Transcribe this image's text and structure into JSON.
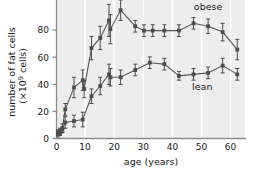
{
  "chart_data": {
    "type": "line",
    "title": "",
    "subtitle": "",
    "xlabel": "age (years)",
    "ylabel_line1": "number of fat cells",
    "ylabel_line2_prefix": "(×10",
    "ylabel_line2_exp": "9",
    "ylabel_line2_suffix": " cells)",
    "ylabel_full": "number of fat cells (×10⁹ cells)",
    "xlim": [
      0,
      65
    ],
    "ylim": [
      0,
      95
    ],
    "xticks": [
      0,
      10,
      20,
      30,
      40,
      50,
      60
    ],
    "xticklabels": [
      "0",
      "10",
      "20",
      "30",
      "40",
      "50",
      "60"
    ],
    "yticks": [
      0,
      20,
      40,
      60,
      80
    ],
    "yticklabels": [
      "0",
      "20",
      "40",
      "60",
      "80"
    ],
    "grid": "vertical-white-bands",
    "legend_position": "inline-annotation",
    "error_bars": "vertical",
    "marker": "filled-square",
    "plot_background": "#eeeeee",
    "line_color": "#595959",
    "marker_color": "#4d4d4d",
    "axis_color": "#808080",
    "gridline_color": "#ffffff",
    "annotations": [
      {
        "text": "obese",
        "x": 52,
        "y": 88
      },
      {
        "text": "lean",
        "x": 50,
        "y": 33
      }
    ],
    "series": [
      {
        "name": "obese",
        "label": "obese",
        "x": [
          0.5,
          1.2,
          2,
          3,
          6,
          9,
          9.5,
          12,
          15,
          18,
          18.5,
          22,
          27,
          30,
          33,
          37,
          42,
          47,
          52,
          57,
          62
        ],
        "values": [
          4,
          5,
          7,
          20,
          35,
          40,
          34,
          62,
          69,
          81,
          75,
          88,
          77,
          74,
          74,
          74,
          74,
          79,
          77,
          73,
          61
        ],
        "errors": [
          2,
          2,
          3,
          4,
          7,
          7,
          6,
          8,
          8,
          11,
          10,
          7,
          4,
          4,
          4,
          4,
          4,
          4,
          5,
          6,
          7
        ]
      },
      {
        "name": "lean",
        "label": "lean",
        "x": [
          0.5,
          1.2,
          2,
          3,
          6,
          9,
          12,
          15,
          18,
          18.5,
          22,
          27,
          32,
          37,
          42,
          47,
          52,
          57,
          62
        ],
        "values": [
          3,
          4,
          6,
          11,
          12,
          13,
          29,
          36,
          44,
          42,
          42,
          47,
          52,
          51,
          43,
          44,
          45,
          50,
          44
        ],
        "errors": [
          2,
          2,
          2,
          4,
          4,
          5,
          5,
          6,
          7,
          6,
          5,
          4,
          4,
          4,
          3,
          4,
          4,
          5,
          4
        ]
      }
    ]
  }
}
